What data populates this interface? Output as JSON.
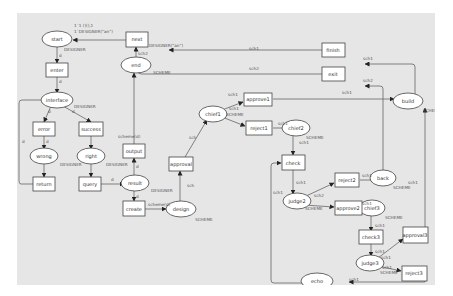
{
  "diagram": {
    "type": "petri-net",
    "background": "#e6e6e6",
    "stroke_color": "#555555",
    "places": [
      {
        "id": "start",
        "label": "start",
        "x": 40,
        "y": 26,
        "type_label": "DESIGNER",
        "token_label": "1`1 ()(),1",
        "marking": "1`DESIGNER(\"an\")"
      },
      {
        "id": "interface",
        "label": "interface",
        "x": 67,
        "y": 87,
        "type_label": "DESIGNER"
      },
      {
        "id": "wrong",
        "label": "wrong",
        "x": 42,
        "y": 143,
        "type_label": "DESIGNER"
      },
      {
        "id": "right",
        "label": "right",
        "x": 89,
        "y": 143,
        "type_label": "DESIGNER"
      },
      {
        "id": "result",
        "label": "result",
        "x": 135,
        "y": 168,
        "type_label": "DESIGNER"
      },
      {
        "id": "design",
        "label": "design",
        "x": 177,
        "y": 196,
        "type_label": "SCHEME"
      },
      {
        "id": "end",
        "label": "end",
        "x": 136,
        "y": 52,
        "type_label": "SCHEME"
      },
      {
        "id": "chief1",
        "label": "chief1",
        "x": 212,
        "y": 101,
        "type_label": "SCHEME"
      },
      {
        "id": "chief2",
        "label": "chief2",
        "x": 292,
        "y": 115,
        "type_label": "SCHEME"
      },
      {
        "id": "judge2",
        "label": "judge2",
        "x": 295,
        "y": 188,
        "type_label": "SCHEME"
      },
      {
        "id": "back",
        "label": "back",
        "x": 370,
        "y": 165,
        "type_label": "SCHEME"
      },
      {
        "id": "chief3",
        "label": "chief3",
        "x": 371,
        "y": 195,
        "type_label": "SCHEME"
      },
      {
        "id": "judge3",
        "label": "judge3",
        "x": 368,
        "y": 250,
        "type_label": "SCHEME"
      },
      {
        "id": "build",
        "label": "build",
        "x": 408,
        "y": 88,
        "type_label": "SCHEME"
      },
      {
        "id": "echo",
        "label": "echo",
        "x": 316,
        "y": 272,
        "type_label": "SCHEME"
      }
    ],
    "transitions": [
      {
        "id": "next",
        "label": "next",
        "x": 136,
        "y": 27
      },
      {
        "id": "enter",
        "label": "enter",
        "x": 68,
        "y": 57
      },
      {
        "id": "error",
        "label": "error",
        "x": 44,
        "y": 116
      },
      {
        "id": "success",
        "label": "success",
        "x": 91,
        "y": 116
      },
      {
        "id": "return",
        "label": "return",
        "x": 44,
        "y": 171
      },
      {
        "id": "query",
        "label": "query",
        "x": 91,
        "y": 171
      },
      {
        "id": "output",
        "label": "output",
        "x": 134,
        "y": 138
      },
      {
        "id": "create",
        "label": "create",
        "x": 134,
        "y": 195
      },
      {
        "id": "approval",
        "label": "approval",
        "x": 180,
        "y": 151
      },
      {
        "id": "approve1",
        "label": "approve1",
        "x": 257,
        "y": 86
      },
      {
        "id": "reject1",
        "label": "reject1",
        "x": 259,
        "y": 115
      },
      {
        "id": "check",
        "label": "check",
        "x": 293,
        "y": 150
      },
      {
        "id": "reject2",
        "label": "reject2",
        "x": 332,
        "y": 167
      },
      {
        "id": "approve2",
        "label": "approve2",
        "x": 333,
        "y": 195
      },
      {
        "id": "check3",
        "label": "check3",
        "x": 371,
        "y": 224
      },
      {
        "id": "approval3",
        "label": "approval3",
        "x": 413,
        "y": 222
      },
      {
        "id": "reject3",
        "label": "reject3",
        "x": 413,
        "y": 260
      },
      {
        "id": "finish",
        "label": "finish",
        "x": 335,
        "y": 52
      },
      {
        "id": "exit",
        "label": "exit",
        "x": 335,
        "y": 73
      }
    ],
    "arc_labels": [
      {
        "text": "d",
        "x": 55,
        "y": 44
      },
      {
        "text": "d",
        "x": 55,
        "y": 70
      },
      {
        "text": "d",
        "x": 43,
        "y": 102
      },
      {
        "text": "d",
        "x": 71,
        "y": 102
      },
      {
        "text": "d",
        "x": 24,
        "y": 127
      },
      {
        "text": "d",
        "x": 54,
        "y": 131
      },
      {
        "text": "d",
        "x": 111,
        "y": 166
      },
      {
        "text": "d",
        "x": 132,
        "y": 155
      },
      {
        "text": "d",
        "x": 132,
        "y": 181
      },
      {
        "text": "scheme(d)",
        "x": 146,
        "y": 194
      },
      {
        "text": "scheme(d)",
        "x": 114,
        "y": 106
      },
      {
        "text": "sch",
        "x": 200,
        "y": 179
      },
      {
        "text": "sch",
        "x": 186,
        "y": 124
      },
      {
        "text": "sch2",
        "x": 122,
        "y": 41
      },
      {
        "text": "DESIGNER(\"an\")",
        "x": 148,
        "y": 33
      },
      {
        "text": "sch1",
        "x": 231,
        "y": 81
      },
      {
        "text": "sch1",
        "x": 229,
        "y": 95
      },
      {
        "text": "SCHEME",
        "x": 229,
        "y": 102
      },
      {
        "text": "sch1",
        "x": 275,
        "y": 112
      },
      {
        "text": "sch1",
        "x": 297,
        "y": 130
      },
      {
        "text": "sch1",
        "x": 297,
        "y": 171
      },
      {
        "text": "sch1",
        "x": 275,
        "y": 182
      },
      {
        "text": "sch1",
        "x": 316,
        "y": 186
      },
      {
        "text": "SCHEME",
        "x": 312,
        "y": 197
      },
      {
        "text": "sch1",
        "x": 348,
        "y": 163
      },
      {
        "text": "sch1",
        "x": 348,
        "y": 192
      },
      {
        "text": "sch1",
        "x": 376,
        "y": 209
      },
      {
        "text": "sch1",
        "x": 376,
        "y": 240
      },
      {
        "text": "sch1",
        "x": 392,
        "y": 245
      },
      {
        "text": "sch1",
        "x": 381,
        "y": 262
      },
      {
        "text": "SCHEME",
        "x": 380,
        "y": 268
      },
      {
        "text": "sch1",
        "x": 394,
        "y": 172
      },
      {
        "text": "sch1",
        "x": 231,
        "y": 12
      },
      {
        "text": "sch2",
        "x": 231,
        "y": 32
      },
      {
        "text": "sch1",
        "x": 326,
        "y": 62
      },
      {
        "text": "sch2",
        "x": 355,
        "y": 40
      },
      {
        "text": "sch1",
        "x": 355,
        "y": 58
      },
      {
        "text": "sch1",
        "x": 340,
        "y": 259
      },
      {
        "text": "d",
        "x": 24,
        "y": 101
      }
    ]
  }
}
